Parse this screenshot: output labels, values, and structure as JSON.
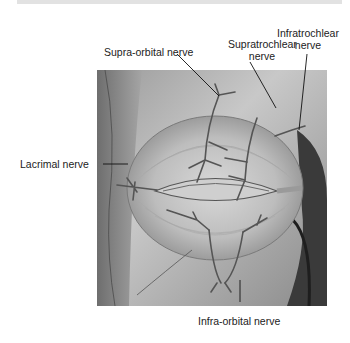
{
  "figure": {
    "labels": {
      "supra_orbital": "Supra-orbital nerve",
      "supratrochlear_line1": "Supratrochlear",
      "supratrochlear_line2": "nerve",
      "infratrochlear_line1": "Infratrochlear",
      "infratrochlear_line2": "nerve",
      "lacrimal": "Lacrimal nerve",
      "infra_orbital": "Infra-orbital nerve"
    },
    "colors": {
      "background": "#ffffff",
      "top_bar": "#e2e2e2",
      "label_text": "#222222",
      "leader_line": "#111111"
    }
  }
}
